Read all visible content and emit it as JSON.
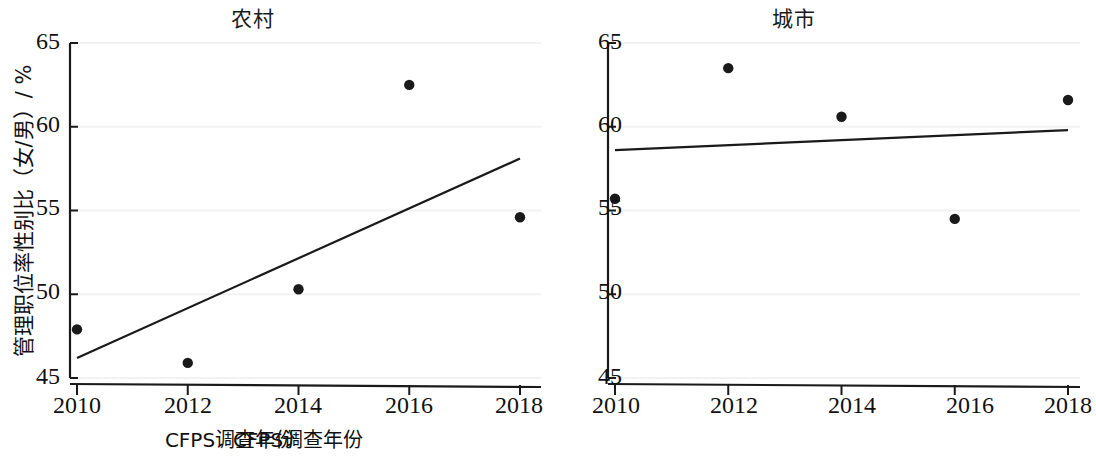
{
  "figure": {
    "width": 1083,
    "height": 456,
    "background": "#ffffff",
    "ink_color": "#1a1a1a",
    "gridline_color": "#f2f2f2"
  },
  "axis_labels": {
    "y": "管理职位率性别比（女/男）/ %",
    "x_rural": "CFPS调查年份",
    "x_urban": "CFPS调查年份"
  },
  "chart_data": [
    {
      "type": "scatter",
      "title": "农村",
      "xlabel": "CFPS调查年份",
      "ylabel": "管理职位率性别比（女/男）/ %",
      "x": [
        2010,
        2012,
        2014,
        2016,
        2018
      ],
      "values": [
        47.9,
        45.9,
        50.3,
        62.5,
        54.6
      ],
      "xlim": [
        2009.2,
        2018.4
      ],
      "ylim": [
        44.6,
        65.3
      ],
      "xticks": [
        2010,
        2012,
        2014,
        2016,
        2018
      ],
      "xticklabels": [
        "2010",
        "2012",
        "2014",
        "2016",
        "2018"
      ],
      "yticks": [
        45,
        50,
        55,
        60,
        65
      ],
      "yticklabels": [
        "45",
        "50",
        "55",
        "60",
        "65"
      ],
      "grid": true,
      "legend": "none",
      "trendline": {
        "name": "线性拟合",
        "x_start": 2010,
        "y_start": 46.2,
        "x_end": 2018,
        "y_end": 58.1
      }
    },
    {
      "type": "scatter",
      "title": "城市",
      "xlabel": "CFPS调查年份",
      "ylabel": "管理职位率性别比（女/男）/ %",
      "x": [
        2010,
        2012,
        2014,
        2016,
        2018
      ],
      "values": [
        55.7,
        63.5,
        60.6,
        54.5,
        61.6
      ],
      "xlim": [
        2009.2,
        2018.4
      ],
      "ylim": [
        44.6,
        65.3
      ],
      "xticks": [
        2010,
        2012,
        2014,
        2016,
        2018
      ],
      "xticklabels": [
        "2010",
        "2012",
        "2014",
        "2016",
        "2018"
      ],
      "yticks": [
        45,
        50,
        55,
        60,
        65
      ],
      "yticklabels": [
        "45",
        "50",
        "55",
        "60",
        "65"
      ],
      "grid": true,
      "legend": "none",
      "trendline": {
        "name": "线性拟合",
        "x_start": 2010,
        "y_start": 58.6,
        "x_end": 2018,
        "y_end": 59.8
      }
    }
  ]
}
